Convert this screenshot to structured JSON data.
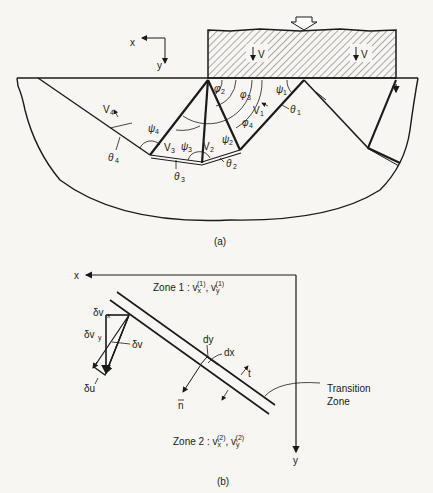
{
  "figure_a": {
    "caption": "(a)",
    "axes": {
      "x_label": "x",
      "y_label": "y"
    },
    "footing_velocity_labels": [
      "V",
      "V"
    ],
    "block_labels": {
      "v1": "V",
      "v1_sub": "1",
      "v2": "V",
      "v2_sub": "2",
      "v3": "V",
      "v3_sub": "3",
      "v4": "V",
      "v4_sub": "4"
    },
    "angles": {
      "psi1": "ψ",
      "psi1_sub": "1",
      "psi2": "ψ",
      "psi2_sub": "2",
      "psi3": "ψ",
      "psi3_sub": "3",
      "psi4": "ψ",
      "psi4_sub": "4",
      "phi2": "φ",
      "phi2_sub": "2",
      "phi3": "φ",
      "phi3_sub": "3",
      "phi4": "φ",
      "phi4_sub": "4",
      "theta1": "θ",
      "theta1_sub": "1",
      "theta2": "θ",
      "theta2_sub": "2",
      "theta3": "θ",
      "theta3_sub": "3",
      "theta4": "θ",
      "theta4_sub": "4"
    }
  },
  "figure_b": {
    "caption": "(b)",
    "axes": {
      "x_label": "x",
      "y_label": "y"
    },
    "zone1": {
      "prefix": "Zone 1 : ",
      "vx": "v",
      "vx_sub": "x",
      "vx_sup": "(1)",
      "sep": ", ",
      "vy": "v",
      "vy_sub": "y",
      "vy_sup": "(1)"
    },
    "zone2": {
      "prefix": "Zone  2  : ",
      "vx": "v",
      "vx_sub": "x",
      "vx_sup": "(2)",
      "sep": ", ",
      "vy": "v",
      "vy_sub": "y",
      "vy_sup": "(2)"
    },
    "vector_labels": {
      "dvx": "δv",
      "dvx_sub": "x",
      "dvy": "δv",
      "dvy_sub": "y",
      "dv": "δv",
      "du": "δu"
    },
    "element_labels": {
      "dy": "dy",
      "dx": "dx",
      "t": "t",
      "n": "n"
    },
    "transition_zone": {
      "line1": "Transition",
      "line2": "Zone"
    }
  }
}
